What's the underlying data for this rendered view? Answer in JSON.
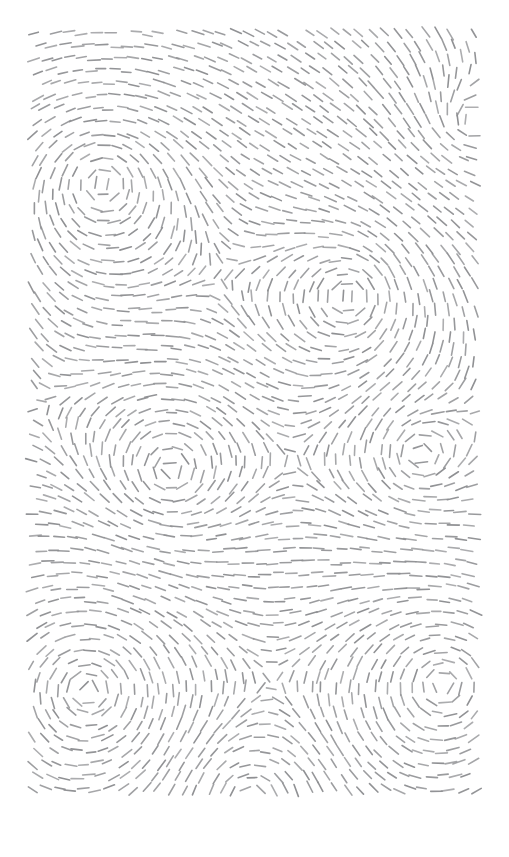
{
  "canvas": {
    "width": 509,
    "height": 857,
    "background_color": "#ffffff",
    "title": "Flow Field Dash Pattern"
  },
  "artwork": {
    "name": "dashed-flow-field",
    "description": "Abstract generative pattern of short gray dashes aligned to a swirling vector field, forming concentric dashed rings around several vortex centers.",
    "stroke_color": "#8f9093",
    "stroke_width": 1.6,
    "stroke_linecap": "round",
    "dash_length": 11,
    "dash_length_jitter": 3.5,
    "plot_area": {
      "x": 33,
      "y": 33,
      "width": 445,
      "height": 767
    },
    "grid": {
      "spacing_x": 12.6,
      "spacing_y": 12.6,
      "position_jitter": 2.6
    },
    "random_seed": 20240817
  },
  "chart_data": {
    "type": "scatter",
    "xlabel": "",
    "ylabel": "",
    "xlim": [
      33,
      478
    ],
    "ylim": [
      33,
      800
    ],
    "grid": false,
    "legend": "none",
    "field_model": "sum of tangential vortex contributions with 1/r falloff plus a weak uniform drift",
    "drift": {
      "angle_deg": 4,
      "weight": 0.18
    },
    "vortices": [
      {
        "name": "vortex-upper-left",
        "x": 103,
        "y": 183,
        "strength": 1.0,
        "direction": "counter-clockwise",
        "falloff": 1.0
      },
      {
        "name": "vortex-upper-center",
        "x": 348,
        "y": 296,
        "strength": 0.92,
        "direction": "counter-clockwise",
        "falloff": 1.0
      },
      {
        "name": "vortex-lower-left",
        "x": 88,
        "y": 690,
        "strength": 0.96,
        "direction": "counter-clockwise",
        "falloff": 1.0
      },
      {
        "name": "vortex-lower-right",
        "x": 444,
        "y": 684,
        "strength": 0.9,
        "direction": "counter-clockwise",
        "falloff": 1.0
      },
      {
        "name": "saddle-mid-left",
        "x": 170,
        "y": 470,
        "strength": -0.55,
        "direction": "clockwise",
        "falloff": 1.0
      },
      {
        "name": "saddle-mid-right",
        "x": 420,
        "y": 455,
        "strength": -0.48,
        "direction": "clockwise",
        "falloff": 1.0
      },
      {
        "name": "saddle-top-right",
        "x": 470,
        "y": 120,
        "strength": -0.4,
        "direction": "clockwise",
        "falloff": 1.0
      },
      {
        "name": "saddle-bottom-mid",
        "x": 250,
        "y": 800,
        "strength": -0.42,
        "direction": "clockwise",
        "falloff": 1.0
      }
    ],
    "series": [
      {
        "name": "dashes",
        "count_x": 36,
        "count_y": 62,
        "total_estimate": 2232
      }
    ]
  }
}
